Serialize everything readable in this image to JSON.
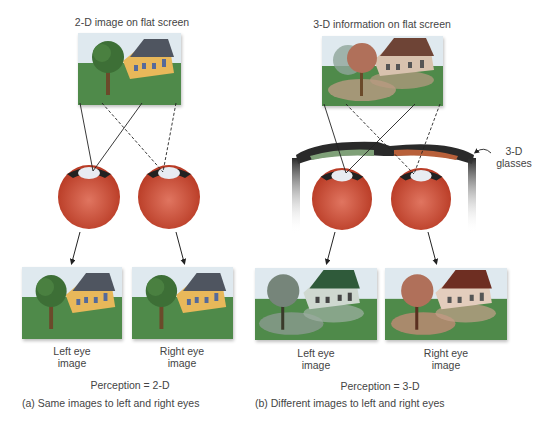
{
  "panel_a": {
    "screen_label": "2-D image  on flat screen",
    "left_eye_label_line1": "Left eye",
    "left_eye_label_line2": "image",
    "right_eye_label_line1": "Right eye",
    "right_eye_label_line2": "image",
    "perception": "Perception = 2-D",
    "caption": "(a)  Same images to left and right eyes"
  },
  "panel_b": {
    "screen_label": "3-D information on flat screen",
    "glasses_label_line1": "3-D",
    "glasses_label_line2": "glasses",
    "left_eye_label_line1": "Left eye",
    "left_eye_label_line2": "image",
    "right_eye_label_line1": "Right eye",
    "right_eye_label_line2": "image",
    "perception": "Perception = 3-D",
    "caption": "(b)  Different images to left and right eyes"
  },
  "colors": {
    "sky": "#dfe9ef",
    "grass": "#4f8a4a",
    "house_yellow": "#e8b85a",
    "roof_gray": "#4f5560",
    "eye_red": "#c9442e",
    "lens_green": "#7fa078",
    "lens_red": "#b8603a"
  }
}
